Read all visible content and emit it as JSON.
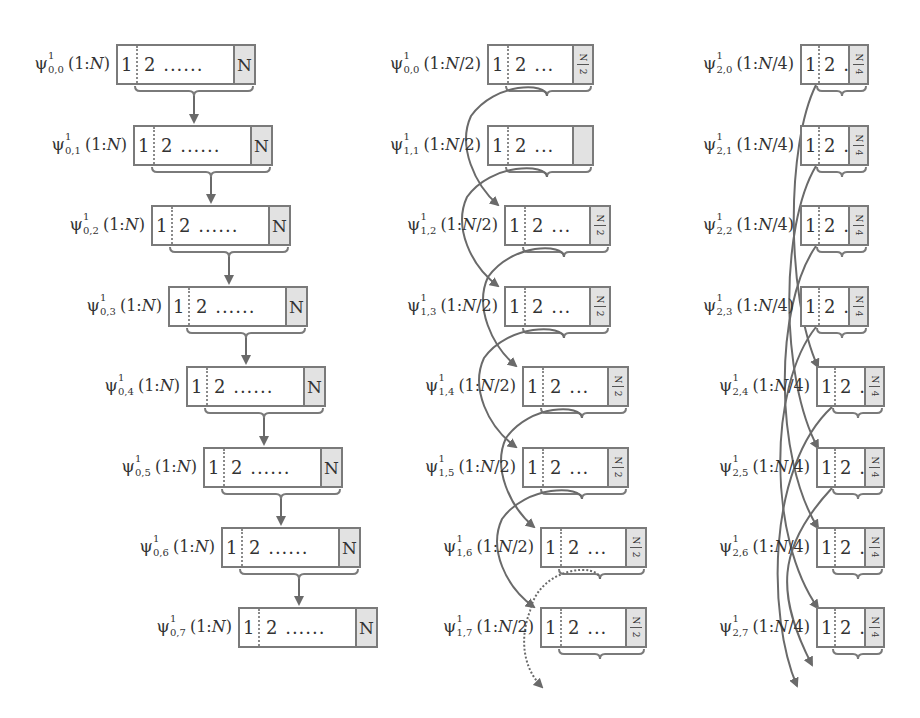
{
  "diagram": {
    "title": "",
    "colors": {
      "stroke": "#7a7a7a",
      "end_cell": "#e2e2e2",
      "text": "#333333"
    },
    "columns": [
      {
        "id": "level0",
        "label_prefix": "ψ",
        "range_text": "(1:N)",
        "range_var": "N",
        "cell_first": "1",
        "cell_second": "2",
        "ellipsis": "......",
        "end_cell": "N",
        "connector": "straight-down-arrow",
        "rows": [
          {
            "sup": "1",
            "sub": "0,0",
            "label": "ψ¹₀,₀(1:N)"
          },
          {
            "sup": "1",
            "sub": "0,1",
            "label": "ψ¹₀,₁(1:N)"
          },
          {
            "sup": "1",
            "sub": "0,2",
            "label": "ψ¹₀,₂(1:N)"
          },
          {
            "sup": "1",
            "sub": "0,3",
            "label": "ψ¹₀,₃(1:N)"
          },
          {
            "sup": "1",
            "sub": "0,4",
            "label": "ψ¹₀,₄(1:N)"
          },
          {
            "sup": "1",
            "sub": "0,5",
            "label": "ψ¹₀,₅(1:N)"
          },
          {
            "sup": "1",
            "sub": "0,6",
            "label": "ψ¹₀,₆(1:N)"
          },
          {
            "sup": "1",
            "sub": "0,7",
            "label": "ψ¹₀,₇(1:N)"
          }
        ]
      },
      {
        "id": "level1",
        "label_prefix": "ψ",
        "range_text": "(1:N/2)",
        "range_var": "N/2",
        "cell_first": "1",
        "cell_second": "2",
        "ellipsis": "...",
        "end_cell": "N/2",
        "connector": "looping-arrow-skip-one",
        "rows": [
          {
            "sup": "1",
            "sub": "0,0",
            "label": "ψ¹₀,₀(1:N/2)",
            "end_label": "N/2"
          },
          {
            "sup": "1",
            "sub": "1,1",
            "label": "ψ¹₁,₁(1:N/2)",
            "end_label": ""
          },
          {
            "sup": "1",
            "sub": "1,2",
            "label": "ψ¹₁,₂(1:N/2)",
            "end_label": "N/2"
          },
          {
            "sup": "1",
            "sub": "1,3",
            "label": "ψ¹₁,₃(1:N/2)",
            "end_label": "N/2"
          },
          {
            "sup": "1",
            "sub": "1,4",
            "label": "ψ¹₁,₄(1:N/2)",
            "end_label": "N/2"
          },
          {
            "sup": "1",
            "sub": "1,5",
            "label": "ψ¹₁,₅(1:N/2)",
            "end_label": "N/2"
          },
          {
            "sup": "1",
            "sub": "1,6",
            "label": "ψ¹₁,₆(1:N/2)",
            "end_label": "N/2"
          },
          {
            "sup": "1",
            "sub": "1,7",
            "label": "ψ¹₁,₇(1:N/2)",
            "end_label": "N/2"
          }
        ]
      },
      {
        "id": "level2",
        "label_prefix": "ψ",
        "range_text": "(1:N/4)",
        "range_var": "N/4",
        "cell_first": "1",
        "cell_second": "2",
        "ellipsis": "..",
        "end_cell": "N/4",
        "connector": "crossing-arrow-skip-three",
        "rows": [
          {
            "sup": "1",
            "sub": "2,0",
            "label": "ψ¹₂,₀(1:N/4)",
            "end_label": "N/4"
          },
          {
            "sup": "1",
            "sub": "2,1",
            "label": "ψ¹₂,₁(1:N/4)",
            "end_label": "N/4"
          },
          {
            "sup": "1",
            "sub": "2,2",
            "label": "ψ¹₂,₂(1:N/4)",
            "end_label": "N/4"
          },
          {
            "sup": "1",
            "sub": "2,3",
            "label": "ψ¹₂,₃(1:N/4)",
            "end_label": "N/4"
          },
          {
            "sup": "1",
            "sub": "2,4",
            "label": "ψ¹₂,₄(1:N/4)",
            "end_label": "N/4"
          },
          {
            "sup": "1",
            "sub": "2,5",
            "label": "ψ¹₂,₅(1:N/4)",
            "end_label": "N/4"
          },
          {
            "sup": "1",
            "sub": "2,6",
            "label": "ψ¹₂,₆(1:N/4)",
            "end_label": "N/4"
          },
          {
            "sup": "1",
            "sub": "2,7",
            "label": "ψ¹₂,₇(1:N/4)",
            "end_label": "N/4"
          }
        ]
      }
    ]
  }
}
